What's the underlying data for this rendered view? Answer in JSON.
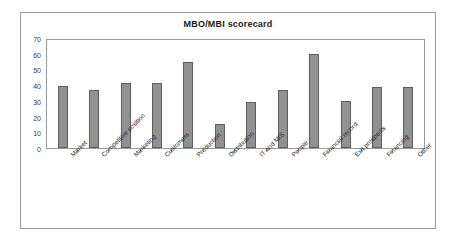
{
  "chart_data": {
    "type": "bar",
    "title": "MBO/MBI scorecard",
    "xlabel": "",
    "ylabel": "",
    "ylim": [
      0,
      70
    ],
    "yticks": [
      0,
      10,
      20,
      30,
      40,
      50,
      60,
      70
    ],
    "grid": false,
    "legend": false,
    "series_color": "#919191",
    "categories": [
      "Market",
      "Competitive position",
      "Marketing",
      "Customers",
      "Production",
      "Distribution",
      "IT and MIS",
      "People",
      "Financial record",
      "Exit prospects",
      "Financing",
      "Other"
    ],
    "values": [
      39.5,
      37,
      41.5,
      41.5,
      54.5,
      15,
      29,
      37,
      60,
      30,
      39,
      39
    ]
  },
  "style": {
    "frame_border_color": "#9a9a9a",
    "bar_fill": "#919191",
    "bar_stroke": "#5e5e5e",
    "text_color": "#262626"
  }
}
